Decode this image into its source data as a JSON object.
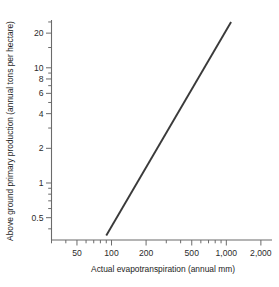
{
  "chart_data": {
    "type": "line",
    "title": "",
    "subtitle": "",
    "xlabel": "Actual evapotranspiration (annual mm)",
    "ylabel": "Above ground primary production (annual tons per hectare)",
    "xscale": "log",
    "yscale": "log",
    "xlim": [
      30,
      2500
    ],
    "ylim": [
      0.32,
      26
    ],
    "grid": false,
    "legend": null,
    "x_ticklabels": [
      "50",
      "100",
      "200",
      "500",
      "1,000",
      "2,000"
    ],
    "x_tickvalues": [
      50,
      100,
      200,
      500,
      1000,
      2000
    ],
    "x_minor_tickvalues": [
      30,
      40,
      60,
      70,
      80,
      90,
      300,
      400,
      600,
      700,
      800,
      900
    ],
    "y_ticklabels": [
      "20",
      "10",
      "8",
      "6",
      "4",
      "2",
      "1",
      "0.5"
    ],
    "y_tickvalues": [
      20,
      10,
      8,
      6,
      4,
      2,
      1,
      0.5
    ],
    "y_minor_tickvalues": [
      0.4,
      0.6,
      0.7,
      0.8,
      0.9,
      3,
      5,
      7,
      9,
      15,
      25
    ],
    "series": [
      {
        "name": "Above ground primary production vs actual evapotranspiration",
        "x": [
          90,
          1100
        ],
        "y": [
          0.35,
          25
        ],
        "color": "#3a3a3a",
        "style": "solid",
        "width": 1.9
      }
    ],
    "annotations": []
  },
  "axes": {
    "x_axis_name": "x-axis",
    "y_axis_name": "y-axis"
  }
}
